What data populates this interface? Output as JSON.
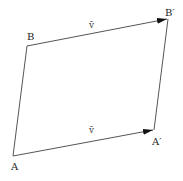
{
  "diagram": {
    "type": "parallelogram-translation",
    "points": {
      "A": {
        "label": "A",
        "x": 13,
        "y": 156
      },
      "B": {
        "label": "B",
        "x": 27,
        "y": 46
      },
      "A_prime": {
        "label": "A′",
        "x": 154,
        "y": 130
      },
      "B_prime": {
        "label": "B′",
        "x": 168,
        "y": 19
      }
    },
    "vectors": [
      {
        "from": "B",
        "to": "B_prime",
        "label": "v̄"
      },
      {
        "from": "A",
        "to": "A_prime",
        "label": "v̄"
      }
    ],
    "colors": {
      "line": "#555555",
      "arrow": "#111111",
      "text": "#222222"
    }
  }
}
